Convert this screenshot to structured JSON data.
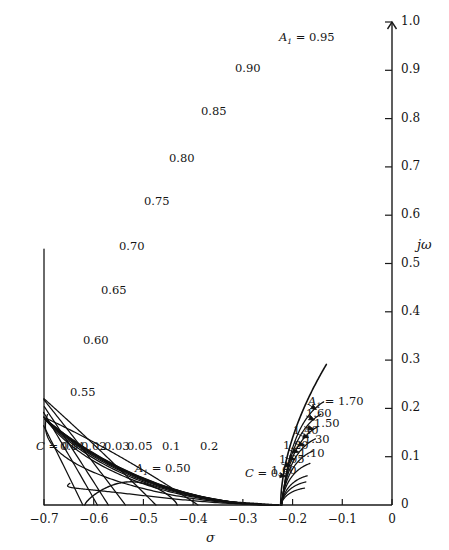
{
  "header": {
    "text": ""
  },
  "chart_data": {
    "type": "line",
    "title": "",
    "xlabel": "σ",
    "ylabel": "jω",
    "xlim": [
      -0.7,
      0.0
    ],
    "ylim": [
      0.0,
      1.0
    ],
    "grid": false,
    "x_ticks": [
      "−0.7",
      "−0.6",
      "−0.5",
      "−0.4",
      "−0.3",
      "−0.2",
      "−0.1",
      "0"
    ],
    "x_tick_values": [
      -0.7,
      -0.6,
      -0.5,
      -0.4,
      -0.3,
      -0.2,
      -0.1,
      0.0
    ],
    "y_ticks": [
      "0",
      "0.1",
      "0.2",
      "0.3",
      "0.4",
      "0.5",
      "0.6",
      "0.7",
      "0.8",
      "0.9",
      "1.0"
    ],
    "y_tick_values": [
      0.0,
      0.1,
      0.2,
      0.3,
      0.4,
      0.5,
      0.6,
      0.7,
      0.8,
      0.9,
      1.0
    ],
    "families": [
      {
        "name": "A1",
        "symbol": "A₁",
        "lead_label": "A₁ = 0.95",
        "values": [
          0.5,
          0.55,
          0.6,
          0.65,
          0.7,
          0.75,
          0.8,
          0.85,
          0.9,
          0.95,
          1.0,
          1.05,
          1.1,
          1.2,
          1.3,
          1.4,
          1.5,
          1.6,
          1.7
        ],
        "labels_upper": [
          "0.95",
          "0.90",
          "0.85",
          "0.80",
          "0.75",
          "0.70",
          "0.65",
          "0.60",
          "0.55"
        ],
        "labels_lower": [
          "1.00",
          "1.05",
          "1.10",
          "1.20",
          "1.30",
          "1.40",
          "1.50",
          "1.60",
          "1.70"
        ],
        "label_lower_lead": "A₁ = 1.70",
        "label_small_arc": "A₁ = 0.50"
      },
      {
        "name": "C",
        "symbol": "C",
        "lead_label": "C = 0 f",
        "values": [
          0.0,
          0.01,
          0.02,
          0.03,
          0.05,
          0.1,
          0.2,
          0.5
        ],
        "labels": [
          "C = 0 f",
          "0.01",
          "0.02",
          "0.03",
          "0.05",
          "0.1",
          "0.2",
          "C = 0.5"
        ]
      }
    ],
    "annotations": [
      {
        "text": "A₁ = 0.95",
        "x": -0.2,
        "y": 0.965
      },
      {
        "text": "0.90",
        "x": -0.287,
        "y": 0.9
      },
      {
        "text": "0.85",
        "x": -0.357,
        "y": 0.812
      },
      {
        "text": "0.80",
        "x": -0.42,
        "y": 0.715
      },
      {
        "text": "0.75",
        "x": -0.47,
        "y": 0.625
      },
      {
        "text": "0.70",
        "x": -0.52,
        "y": 0.532
      },
      {
        "text": "0.65",
        "x": -0.558,
        "y": 0.44
      },
      {
        "text": "0.60",
        "x": -0.593,
        "y": 0.337
      },
      {
        "text": "0.55",
        "x": -0.62,
        "y": 0.23
      },
      {
        "text": "C = 0 f",
        "x": -0.688,
        "y": 0.118
      },
      {
        "text": "0.01",
        "x": -0.64,
        "y": 0.118
      },
      {
        "text": "0.02",
        "x": -0.597,
        "y": 0.118
      },
      {
        "text": "0.03",
        "x": -0.552,
        "y": 0.118
      },
      {
        "text": "0.05",
        "x": -0.505,
        "y": 0.118
      },
      {
        "text": "0.1",
        "x": -0.434,
        "y": 0.118
      },
      {
        "text": "0.2",
        "x": -0.358,
        "y": 0.118
      },
      {
        "text": "A₁ = 0.50",
        "x": -0.488,
        "y": 0.072
      },
      {
        "text": "C = 0.5",
        "x": -0.267,
        "y": 0.062
      },
      {
        "text": "A₁ = 1.70",
        "x": -0.14,
        "y": 0.212
      },
      {
        "text": "1.60",
        "x": -0.145,
        "y": 0.186
      },
      {
        "text": "1.50",
        "x": -0.128,
        "y": 0.166
      },
      {
        "text": "1.40",
        "x": -0.17,
        "y": 0.152
      },
      {
        "text": "1.30",
        "x": -0.148,
        "y": 0.133
      },
      {
        "text": "1.20",
        "x": -0.192,
        "y": 0.12
      },
      {
        "text": "1.10",
        "x": -0.158,
        "y": 0.104
      },
      {
        "text": "1.05",
        "x": -0.2,
        "y": 0.092
      },
      {
        "text": "1.00",
        "x": -0.215,
        "y": 0.068
      }
    ],
    "axis_labels": {
      "x": "σ",
      "y": "jω"
    },
    "legend": {
      "position": "inline-annotations"
    }
  },
  "style": {
    "curve_color": "#101010",
    "axis_color": "#1a1a1a",
    "background": "#ffffff"
  }
}
